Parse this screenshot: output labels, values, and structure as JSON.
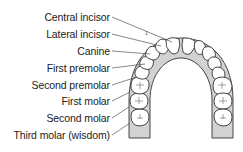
{
  "diagram": {
    "labels": [
      {
        "text": "Central incisor",
        "y": 11
      },
      {
        "text": "Lateral incisor",
        "y": 28
      },
      {
        "text": "Canine",
        "y": 45
      },
      {
        "text": "First premolar",
        "y": 62
      },
      {
        "text": "Second premolar",
        "y": 79
      },
      {
        "text": "First molar",
        "y": 95
      },
      {
        "text": "Second molar",
        "y": 112
      },
      {
        "text": "Third molar (wisdom)",
        "y": 129
      }
    ],
    "tooth_marker": "1",
    "colors": {
      "gum": "#cfcfcf",
      "tooth_fill": "#ffffff",
      "outline": "#333333",
      "leader": "#555555",
      "text": "#222222"
    }
  }
}
